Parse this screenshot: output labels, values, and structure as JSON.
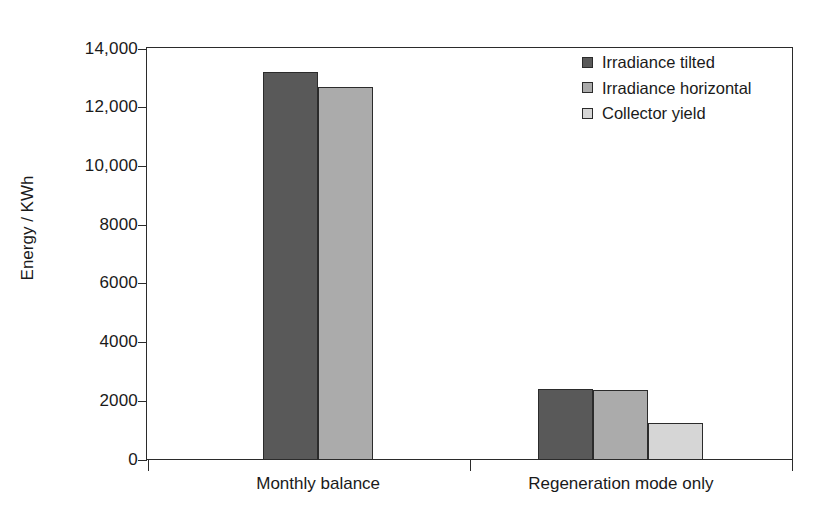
{
  "chart_data": {
    "type": "bar",
    "title": "",
    "xlabel": "",
    "ylabel": "Energy / KWh",
    "categories": [
      "Monthly balance",
      "Regeneration mode only"
    ],
    "series": [
      {
        "name": "Irradiance tilted",
        "color": "#595959",
        "values": [
          13200,
          2400
        ]
      },
      {
        "name": "Irradiance horizontal",
        "color": "#ababab",
        "values": [
          12700,
          2380
        ]
      },
      {
        "name": "Collector yield",
        "color": "#d6d6d6",
        "values": [
          null,
          1250
        ]
      }
    ],
    "ylim": [
      0,
      14000
    ],
    "yticks": [
      0,
      2000,
      4000,
      6000,
      8000,
      10000,
      12000,
      14000
    ],
    "ytick_labels": [
      "0",
      "2000",
      "4000",
      "6000",
      "8000",
      "10,000",
      "12,000",
      "14,000"
    ],
    "grid": false,
    "legend_position": "top-right",
    "axis_color": "#2b2b2b",
    "background": "#ffffff"
  },
  "legend": {
    "items": [
      {
        "label": "Irradiance tilted"
      },
      {
        "label": "Irradiance horizontal"
      },
      {
        "label": "Collector yield"
      }
    ]
  }
}
